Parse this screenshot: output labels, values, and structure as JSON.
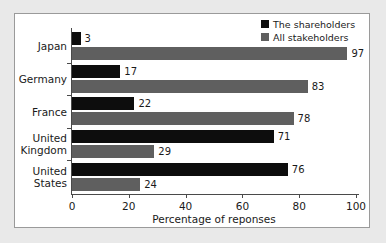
{
  "chart_data": {
    "type": "bar",
    "orientation": "horizontal",
    "title": "",
    "xlabel": "Percentage of reponses",
    "ylabel": "",
    "xlim": [
      0,
      100
    ],
    "xticks": [
      0,
      20,
      40,
      60,
      80,
      100
    ],
    "grid": false,
    "legend_position": "top-right",
    "categories": [
      "Japan",
      "Germany",
      "France",
      "United Kingdom",
      "United States"
    ],
    "category_lines": [
      [
        "Japan"
      ],
      [
        "Germany"
      ],
      [
        "France"
      ],
      [
        "United",
        "Kingdom"
      ],
      [
        "United",
        "States"
      ]
    ],
    "series": [
      {
        "name": "The shareholders",
        "color": "#0d0d0d",
        "values": [
          3,
          17,
          22,
          71,
          76
        ]
      },
      {
        "name": "All stakeholders",
        "color": "#5f5f5f",
        "values": [
          97,
          83,
          78,
          29,
          24
        ]
      }
    ]
  },
  "colors": {
    "page_background": "#e9e9e9",
    "figure_background": "#ffffff",
    "figure_border": "#9a9a9a",
    "axis": "#4a4a4a",
    "text": "#1a1a1a",
    "series_shareholders": "#0d0d0d",
    "series_stakeholders": "#5f5f5f"
  }
}
